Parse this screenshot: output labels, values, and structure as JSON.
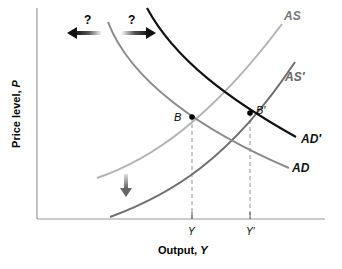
{
  "diagram": {
    "type": "AD-AS model",
    "x_axis": {
      "title": "Output,",
      "title_var": "Y"
    },
    "y_axis": {
      "title": "Price level,",
      "title_var": "P"
    },
    "curves": [
      {
        "id": "AS",
        "label": "AS",
        "color": "#b0b0b0"
      },
      {
        "id": "AS_prime",
        "label": "AS′",
        "color": "#6e6e6e"
      },
      {
        "id": "AD",
        "label": "AD",
        "color": "#8a8a8a"
      },
      {
        "id": "AD_prime",
        "label": "AD′",
        "color": "#111111"
      }
    ],
    "points": [
      {
        "id": "B",
        "label": "B"
      },
      {
        "id": "B_prime",
        "label": "B′"
      }
    ],
    "ticks": [
      {
        "id": "Y",
        "label": "Y"
      },
      {
        "id": "Y_prime",
        "label": "Y′"
      }
    ],
    "arrows": {
      "left_question": "?",
      "right_question": "?",
      "left_arrow_icon": "arrow-left-icon",
      "right_arrow_icon": "arrow-right-icon",
      "down_arrow_icon": "arrow-down-icon"
    }
  }
}
